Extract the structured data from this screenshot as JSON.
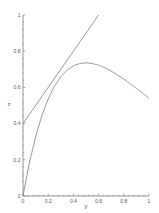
{
  "chart_data": {
    "type": "line",
    "title": "",
    "xlabel": "y",
    "ylabel": "z",
    "xlim": [
      0,
      1
    ],
    "ylim": [
      0,
      1
    ],
    "grid": false,
    "legend": null,
    "x_ticks": [
      "0",
      "0.2",
      "0.4",
      "0.6",
      "0.8",
      "1"
    ],
    "y_ticks": [
      "0",
      "0.2",
      "0.4",
      "0.6",
      "0.8",
      "1"
    ],
    "series": [
      {
        "name": "curve",
        "description": "rises from origin, peaks near (0.5, 0.74), declines to ~0.54 at 1",
        "x": [
          0,
          0.05,
          0.1,
          0.15,
          0.2,
          0.25,
          0.3,
          0.35,
          0.4,
          0.45,
          0.5,
          0.55,
          0.6,
          0.65,
          0.7,
          0.75,
          0.8,
          0.85,
          0.9,
          0.95,
          1.0
        ],
        "values": [
          0,
          0.181,
          0.327,
          0.445,
          0.536,
          0.607,
          0.659,
          0.695,
          0.719,
          0.732,
          0.736,
          0.732,
          0.723,
          0.709,
          0.69,
          0.669,
          0.646,
          0.62,
          0.595,
          0.568,
          0.541
        ]
      },
      {
        "name": "line",
        "description": "straight line z = y + 0.4",
        "x": [
          0,
          0.6
        ],
        "values": [
          0.4,
          1.0
        ]
      }
    ]
  },
  "colors": {
    "axis": "#666666",
    "line": "#8c8c8c",
    "label": "#555555"
  }
}
